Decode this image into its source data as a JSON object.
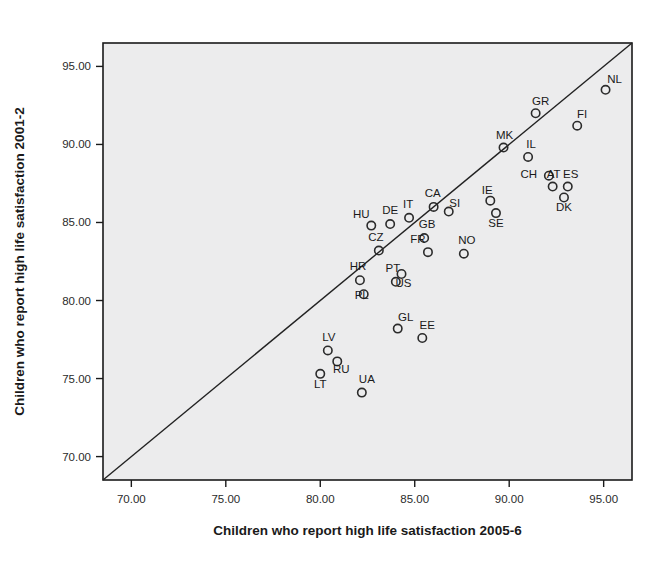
{
  "chart_data": {
    "type": "scatter",
    "title": "",
    "xlabel": "Children who report high life satisfaction 2005-6",
    "ylabel": "Children who report high life satisfaction 2001-2",
    "xlim": [
      68.5,
      96.5
    ],
    "ylim": [
      68.5,
      96.5
    ],
    "xticks": [
      70,
      75,
      80,
      85,
      90,
      95
    ],
    "yticks": [
      70,
      75,
      80,
      85,
      90,
      95
    ],
    "xticklabels": [
      "70.00",
      "75.00",
      "80.00",
      "85.00",
      "90.00",
      "95.00"
    ],
    "yticklabels": [
      "70.00",
      "75.00",
      "80.00",
      "85.00",
      "90.00",
      "95.00"
    ],
    "grid": false,
    "legend": null,
    "reference_line": {
      "type": "identity",
      "description": "y = x diagonal line",
      "from": [
        68.5,
        68.5
      ],
      "to": [
        96.5,
        96.5
      ]
    },
    "point_label_key": "country_code",
    "points": [
      {
        "label": "NL",
        "x": 95.1,
        "y": 93.5,
        "label_dx": 9,
        "label_dy": -7
      },
      {
        "label": "GR",
        "x": 91.4,
        "y": 92.0,
        "label_dx": 5,
        "label_dy": -8
      },
      {
        "label": "FI",
        "x": 93.6,
        "y": 91.2,
        "label_dx": 5,
        "label_dy": -8
      },
      {
        "label": "MK",
        "x": 89.7,
        "y": 89.8,
        "label_dx": 1,
        "label_dy": -9
      },
      {
        "label": "IL",
        "x": 91.0,
        "y": 89.2,
        "label_dx": 3,
        "label_dy": -9
      },
      {
        "label": "CH",
        "x": 92.1,
        "y": 88.0,
        "label_dx": -20,
        "label_dy": 2
      },
      {
        "label": "AT",
        "x": 92.3,
        "y": 87.3,
        "label_dx": 1,
        "label_dy": -9
      },
      {
        "label": "ES",
        "x": 93.1,
        "y": 87.3,
        "label_dx": 3,
        "label_dy": -9
      },
      {
        "label": "DK",
        "x": 92.9,
        "y": 86.6,
        "label_dx": 0,
        "label_dy": 13
      },
      {
        "label": "IE",
        "x": 89.0,
        "y": 86.4,
        "label_dx": -3,
        "label_dy": -7
      },
      {
        "label": "SE",
        "x": 89.3,
        "y": 85.6,
        "label_dx": 0,
        "label_dy": 14
      },
      {
        "label": "CA",
        "x": 86.0,
        "y": 86.0,
        "label_dx": -1,
        "label_dy": -10
      },
      {
        "label": "SI",
        "x": 86.8,
        "y": 85.7,
        "label_dx": 6,
        "label_dy": -5
      },
      {
        "label": "IT",
        "x": 84.7,
        "y": 85.3,
        "label_dx": -1,
        "label_dy": -10
      },
      {
        "label": "DE",
        "x": 83.7,
        "y": 84.9,
        "label_dx": 0,
        "label_dy": -10
      },
      {
        "label": "HU",
        "x": 82.7,
        "y": 84.8,
        "label_dx": -10,
        "label_dy": -8
      },
      {
        "label": "GB",
        "x": 85.5,
        "y": 84.0,
        "label_dx": 3,
        "label_dy": -10
      },
      {
        "label": "CZ",
        "x": 83.1,
        "y": 83.2,
        "label_dx": -3,
        "label_dy": -10
      },
      {
        "label": "FR",
        "x": 85.7,
        "y": 83.1,
        "label_dx": -10,
        "label_dy": -9
      },
      {
        "label": "NO",
        "x": 87.6,
        "y": 83.0,
        "label_dx": 3,
        "label_dy": -10
      },
      {
        "label": "US",
        "x": 84.3,
        "y": 81.7,
        "label_dx": 2,
        "label_dy": 13
      },
      {
        "label": "HR",
        "x": 82.1,
        "y": 81.3,
        "label_dx": -2,
        "label_dy": -10
      },
      {
        "label": "PT",
        "x": 84.0,
        "y": 81.2,
        "label_dx": -3,
        "label_dy": -10
      },
      {
        "label": "PL",
        "x": 82.3,
        "y": 80.4,
        "label_dx": -2,
        "label_dy": 5
      },
      {
        "label": "GL",
        "x": 84.1,
        "y": 78.2,
        "label_dx": 8,
        "label_dy": -8
      },
      {
        "label": "LV",
        "x": 80.4,
        "y": 76.8,
        "label_dx": 1,
        "label_dy": -9
      },
      {
        "label": "RU",
        "x": 80.9,
        "y": 76.1,
        "label_dx": 4,
        "label_dy": 12
      },
      {
        "label": "EE",
        "x": 85.4,
        "y": 77.6,
        "label_dx": 5,
        "label_dy": -9
      },
      {
        "label": "LT",
        "x": 80.0,
        "y": 75.3,
        "label_dx": 0,
        "label_dy": 14
      },
      {
        "label": "UA",
        "x": 82.2,
        "y": 74.1,
        "label_dx": 5,
        "label_dy": -10
      }
    ]
  },
  "colors": {
    "plot_background": "#ececed",
    "frame": "#1a1a1a",
    "marker": "#2b2b2b",
    "reference_line": "#222222",
    "text": "#1a1a1a",
    "page_background": "#ffffff"
  }
}
